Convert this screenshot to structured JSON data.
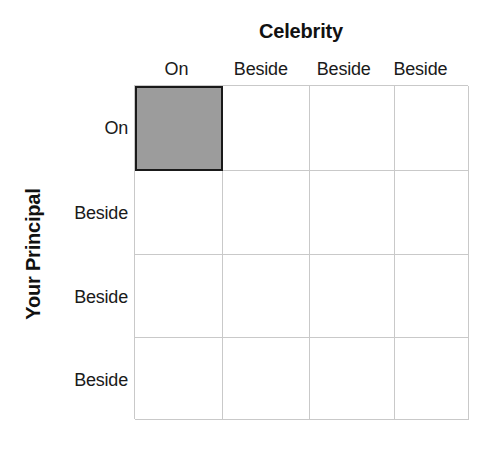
{
  "chart_data": {
    "type": "table",
    "title": "",
    "column_axis_title": "Celebrity",
    "row_axis_title": "Your Principal",
    "column_headers": [
      "On",
      "Beside",
      "Beside",
      "Beside"
    ],
    "row_headers": [
      "On",
      "Beside",
      "Beside",
      "Beside"
    ],
    "grid": {
      "rows": 4,
      "columns": 4,
      "gridline_color": "#c9c9c9",
      "cell_background": "#ffffff"
    },
    "cells": [
      [
        {
          "row": "On",
          "column": "On",
          "state": "shaded",
          "fill": "#9c9c9c",
          "border": "#1a1a1a"
        },
        {
          "row": "On",
          "column": "Beside",
          "state": "empty",
          "fill": "#ffffff"
        },
        {
          "row": "On",
          "column": "Beside",
          "state": "empty",
          "fill": "#ffffff"
        },
        {
          "row": "On",
          "column": "Beside",
          "state": "empty",
          "fill": "#ffffff"
        }
      ],
      [
        {
          "row": "Beside",
          "column": "On",
          "state": "empty",
          "fill": "#ffffff"
        },
        {
          "row": "Beside",
          "column": "Beside",
          "state": "empty",
          "fill": "#ffffff"
        },
        {
          "row": "Beside",
          "column": "Beside",
          "state": "empty",
          "fill": "#ffffff"
        },
        {
          "row": "Beside",
          "column": "Beside",
          "state": "empty",
          "fill": "#ffffff"
        }
      ],
      [
        {
          "row": "Beside",
          "column": "On",
          "state": "empty",
          "fill": "#ffffff"
        },
        {
          "row": "Beside",
          "column": "Beside",
          "state": "empty",
          "fill": "#ffffff"
        },
        {
          "row": "Beside",
          "column": "Beside",
          "state": "empty",
          "fill": "#ffffff"
        },
        {
          "row": "Beside",
          "column": "Beside",
          "state": "empty",
          "fill": "#ffffff"
        }
      ],
      [
        {
          "row": "Beside",
          "column": "On",
          "state": "empty",
          "fill": "#ffffff"
        },
        {
          "row": "Beside",
          "column": "Beside",
          "state": "empty",
          "fill": "#ffffff"
        },
        {
          "row": "Beside",
          "column": "Beside",
          "state": "empty",
          "fill": "#ffffff"
        },
        {
          "row": "Beside",
          "column": "Beside",
          "state": "empty",
          "fill": "#ffffff"
        }
      ]
    ],
    "selected_cell": {
      "row_index": 0,
      "column_index": 0
    },
    "background_color": "#ffffff",
    "text_color": "#1a1a1a"
  }
}
